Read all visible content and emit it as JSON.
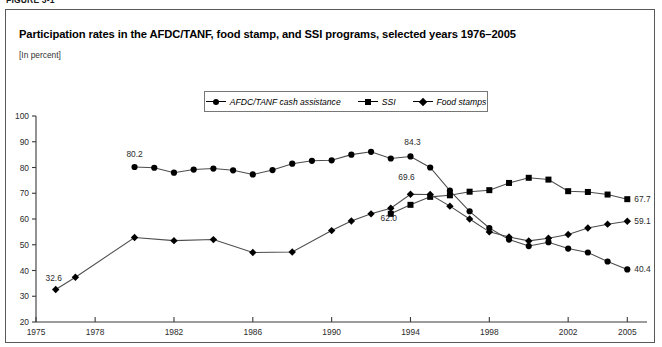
{
  "figure": {
    "figure_label": "FIGURE 3-1",
    "title": "Participation rates in the AFDC/TANF, food stamp, and SSI programs, selected years 1976–2005",
    "subtitle": "[In percent]"
  },
  "legend": {
    "items": [
      {
        "label": "AFDC/TANF cash assistance",
        "marker": "circle"
      },
      {
        "label": "SSI",
        "marker": "square"
      },
      {
        "label": "Food stamps",
        "marker": "diamond"
      }
    ]
  },
  "chart_data": {
    "type": "line",
    "title": "Participation rates in the AFDC/TANF, food stamp, and SSI programs, selected years 1976–2005",
    "subtitle": "[In percent]",
    "xlabel": "",
    "ylabel": "",
    "xlim": [
      1975,
      2006
    ],
    "ylim": [
      20,
      100
    ],
    "ytick_values": [
      20,
      30,
      40,
      50,
      60,
      70,
      80,
      90,
      100
    ],
    "ytick_labels": [
      "20",
      "30",
      "40",
      "50",
      "60",
      "70",
      "80",
      "90",
      "100"
    ],
    "xtick_values": [
      1975,
      1978,
      1982,
      1986,
      1990,
      1994,
      1998,
      2002,
      2005
    ],
    "xtick_labels": [
      "1975",
      "1978",
      "1982",
      "1986",
      "1990",
      "1994",
      "1998",
      "2002",
      "2005"
    ],
    "grid": false,
    "legend_position": "top-center",
    "series": [
      {
        "name": "AFDC/TANF cash assistance",
        "marker": "circle",
        "x": [
          1980,
          1981,
          1982,
          1983,
          1984,
          1985,
          1986,
          1987,
          1988,
          1989,
          1990,
          1991,
          1992,
          1993,
          1994,
          1995,
          1996,
          1997,
          1998,
          1999,
          2000,
          2001,
          2002,
          2003,
          2004,
          2005
        ],
        "y": [
          80.2,
          79.9,
          78.0,
          79.2,
          79.6,
          78.9,
          77.3,
          79.0,
          81.5,
          82.6,
          82.8,
          85.0,
          86.1,
          83.5,
          84.3,
          80.0,
          71.0,
          63.0,
          56.5,
          52.0,
          49.5,
          51.0,
          48.5,
          47.0,
          43.5,
          40.4
        ]
      },
      {
        "name": "SSI",
        "marker": "square",
        "x": [
          1993,
          1994,
          1995,
          1996,
          1997,
          1998,
          1999,
          2000,
          2001,
          2002,
          2003,
          2004,
          2005
        ],
        "y": [
          62.0,
          65.5,
          68.6,
          69.2,
          70.6,
          71.2,
          74.0,
          76.0,
          75.3,
          70.8,
          70.5,
          69.5,
          67.7
        ]
      },
      {
        "name": "Food stamps",
        "marker": "diamond",
        "x": [
          1976,
          1977,
          1980,
          1982,
          1984,
          1986,
          1988,
          1990,
          1991,
          1992,
          1993,
          1994,
          1995,
          1996,
          1997,
          1998,
          1999,
          2000,
          2001,
          2002,
          2003,
          2004,
          2005
        ],
        "y": [
          32.6,
          37.4,
          52.8,
          51.6,
          52.0,
          47.0,
          47.2,
          55.5,
          59.2,
          62.0,
          64.2,
          69.6,
          69.5,
          65.0,
          60.0,
          55.0,
          53.0,
          51.5,
          52.5,
          54.0,
          56.5,
          58.0,
          59.1
        ]
      }
    ],
    "point_labels": [
      {
        "series": "Food stamps",
        "x": 1976,
        "y": 32.6,
        "text": "32.6"
      },
      {
        "series": "AFDC/TANF cash assistance",
        "x": 1980,
        "y": 80.2,
        "text": "80.2"
      },
      {
        "series": "SSI",
        "x": 1993,
        "y": 62.0,
        "text": "62.0"
      },
      {
        "series": "Food stamps",
        "x": 1994,
        "y": 69.6,
        "text": "69.6"
      },
      {
        "series": "AFDC/TANF cash assistance",
        "x": 1994,
        "y": 84.3,
        "text": "84.3"
      },
      {
        "series": "SSI",
        "x": 2005,
        "y": 67.7,
        "text": "67.7"
      },
      {
        "series": "Food stamps",
        "x": 2005,
        "y": 59.1,
        "text": "59.1"
      },
      {
        "series": "AFDC/TANF cash assistance",
        "x": 2005,
        "y": 40.4,
        "text": "40.4"
      }
    ]
  }
}
